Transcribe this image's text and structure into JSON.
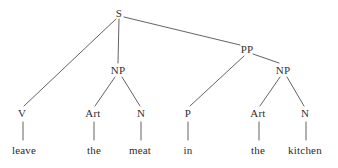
{
  "figure": {
    "kind": "constituency-parse-tree",
    "sentence": "leave the meat in the kitchen",
    "background_color": "#ffffff",
    "line_color": "#55504e",
    "text_color": "#33302f"
  },
  "nodes": [
    {
      "id": "S",
      "label": "S",
      "type": "phrase",
      "x": 119,
      "y": 13
    },
    {
      "id": "V",
      "label": "V",
      "type": "pos",
      "x": 22,
      "y": 113
    },
    {
      "id": "NP1",
      "label": "NP",
      "type": "phrase",
      "x": 118,
      "y": 70
    },
    {
      "id": "PP",
      "label": "PP",
      "type": "phrase",
      "x": 247,
      "y": 49
    },
    {
      "id": "Art1",
      "label": "Art",
      "type": "pos",
      "x": 93,
      "y": 113
    },
    {
      "id": "N1",
      "label": "N",
      "type": "pos",
      "x": 141,
      "y": 113
    },
    {
      "id": "P",
      "label": "P",
      "type": "pos",
      "x": 188,
      "y": 113
    },
    {
      "id": "NP2",
      "label": "NP",
      "type": "phrase",
      "x": 283,
      "y": 70
    },
    {
      "id": "Art2",
      "label": "Art",
      "type": "pos",
      "x": 258,
      "y": 113
    },
    {
      "id": "N2",
      "label": "N",
      "type": "pos",
      "x": 305,
      "y": 113
    },
    {
      "id": "w1",
      "label": "leave",
      "type": "word",
      "x": 24,
      "y": 150
    },
    {
      "id": "w2",
      "label": "the",
      "type": "word",
      "x": 94,
      "y": 150
    },
    {
      "id": "w3",
      "label": "meat",
      "type": "word",
      "x": 140,
      "y": 150
    },
    {
      "id": "w4",
      "label": "in",
      "type": "word",
      "x": 188,
      "y": 150
    },
    {
      "id": "w5",
      "label": "the",
      "type": "word",
      "x": 258,
      "y": 150
    },
    {
      "id": "w6",
      "label": "kitchen",
      "type": "word",
      "x": 305,
      "y": 150
    }
  ],
  "edges": [
    {
      "from": "S",
      "to": "V",
      "x1": 116,
      "y1": 19,
      "x2": 24,
      "y2": 106
    },
    {
      "from": "S",
      "to": "NP1",
      "x1": 119,
      "y1": 19,
      "x2": 118,
      "y2": 63
    },
    {
      "from": "S",
      "to": "PP",
      "x1": 124,
      "y1": 17,
      "x2": 240,
      "y2": 45
    },
    {
      "from": "NP1",
      "to": "Art1",
      "x1": 115,
      "y1": 77,
      "x2": 95,
      "y2": 106
    },
    {
      "from": "NP1",
      "to": "N1",
      "x1": 122,
      "y1": 77,
      "x2": 140,
      "y2": 106
    },
    {
      "from": "PP",
      "to": "P",
      "x1": 244,
      "y1": 56,
      "x2": 190,
      "y2": 106
    },
    {
      "from": "PP",
      "to": "NP2",
      "x1": 253,
      "y1": 54,
      "x2": 279,
      "y2": 63
    },
    {
      "from": "NP2",
      "to": "Art2",
      "x1": 280,
      "y1": 77,
      "x2": 260,
      "y2": 106
    },
    {
      "from": "NP2",
      "to": "N2",
      "x1": 287,
      "y1": 77,
      "x2": 304,
      "y2": 106
    },
    {
      "from": "V",
      "to": "w1",
      "x1": 23,
      "y1": 122,
      "x2": 23,
      "y2": 140
    },
    {
      "from": "Art1",
      "to": "w2",
      "x1": 94,
      "y1": 122,
      "x2": 94,
      "y2": 140
    },
    {
      "from": "N1",
      "to": "w3",
      "x1": 141,
      "y1": 122,
      "x2": 141,
      "y2": 140
    },
    {
      "from": "P",
      "to": "w4",
      "x1": 188,
      "y1": 122,
      "x2": 188,
      "y2": 140
    },
    {
      "from": "Art2",
      "to": "w5",
      "x1": 259,
      "y1": 122,
      "x2": 259,
      "y2": 140
    },
    {
      "from": "N2",
      "to": "w6",
      "x1": 306,
      "y1": 122,
      "x2": 306,
      "y2": 140
    }
  ]
}
